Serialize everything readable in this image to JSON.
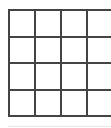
{
  "grid": {
    "rows": 4,
    "columns": 4,
    "line_color": "#444444",
    "cell_color": "#ffffff",
    "cells": [
      [
        "",
        "",
        "",
        ""
      ],
      [
        "",
        "",
        "",
        ""
      ],
      [
        "",
        "",
        "",
        ""
      ],
      [
        "",
        "",
        "",
        ""
      ]
    ]
  },
  "colors": {
    "background": "#ffffff",
    "bottom_rule": "#e6e6e6"
  }
}
